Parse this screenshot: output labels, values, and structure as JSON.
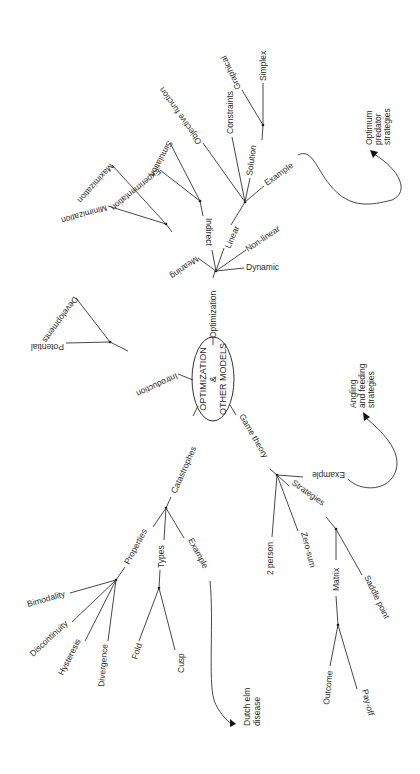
{
  "diagram": {
    "type": "mind-map",
    "orientation": "rotated 90deg clockwise",
    "center": {
      "line1": "OPTIMIZATION",
      "line2": "&",
      "line3": "OTHER MODELS"
    },
    "branches": {
      "optimization": {
        "label": "Optimization",
        "children": {
          "meaning": {
            "label": "Meaning",
            "children": [
              "Minimization",
              "Maximization"
            ]
          },
          "indirect": {
            "label": "Indirect",
            "children": [
              "Experimentation",
              "Simulation"
            ]
          },
          "linear": {
            "label": "Linear",
            "children": {
              "objective": "Objective function",
              "constraints": "Constraints",
              "solution": {
                "label": "Solution",
                "children": [
                  "Graphical",
                  "Simplex"
                ]
              },
              "example": "Example"
            }
          },
          "nonlinear": "Non-linear",
          "dynamic": "Dynamic"
        },
        "example_target": {
          "line1": "Optimum",
          "line2": "predator",
          "line3": "strategies"
        }
      },
      "introduction": {
        "label": "Introduction",
        "children": [
          "Potential",
          "Developments"
        ]
      },
      "catastrophes": {
        "label": "Catastrophes",
        "children": {
          "properties": {
            "label": "Properties",
            "children": [
              "Bimodality",
              "Discontinuity",
              "Hysteresis",
              "Divergence"
            ]
          },
          "types": {
            "label": "Types",
            "children": [
              "Fold",
              "Cusp"
            ]
          },
          "example": "Example"
        },
        "example_target": {
          "line1": "Dutch elm",
          "line2": "disease"
        }
      },
      "game_theory": {
        "label": "Game theory",
        "children": {
          "example": "Example",
          "strategies": {
            "label": "Strategies",
            "children": {
              "matrix": {
                "label": "Matrix",
                "children": [
                  "Outcome",
                  "Pay-off"
                ]
              },
              "saddle": "Saddle point"
            }
          },
          "zero_sum": "Zero-sum",
          "two_person": "2 person"
        },
        "example_target": {
          "line1": "Angling",
          "line2": "and feeding",
          "line3": "strategies"
        }
      }
    }
  }
}
